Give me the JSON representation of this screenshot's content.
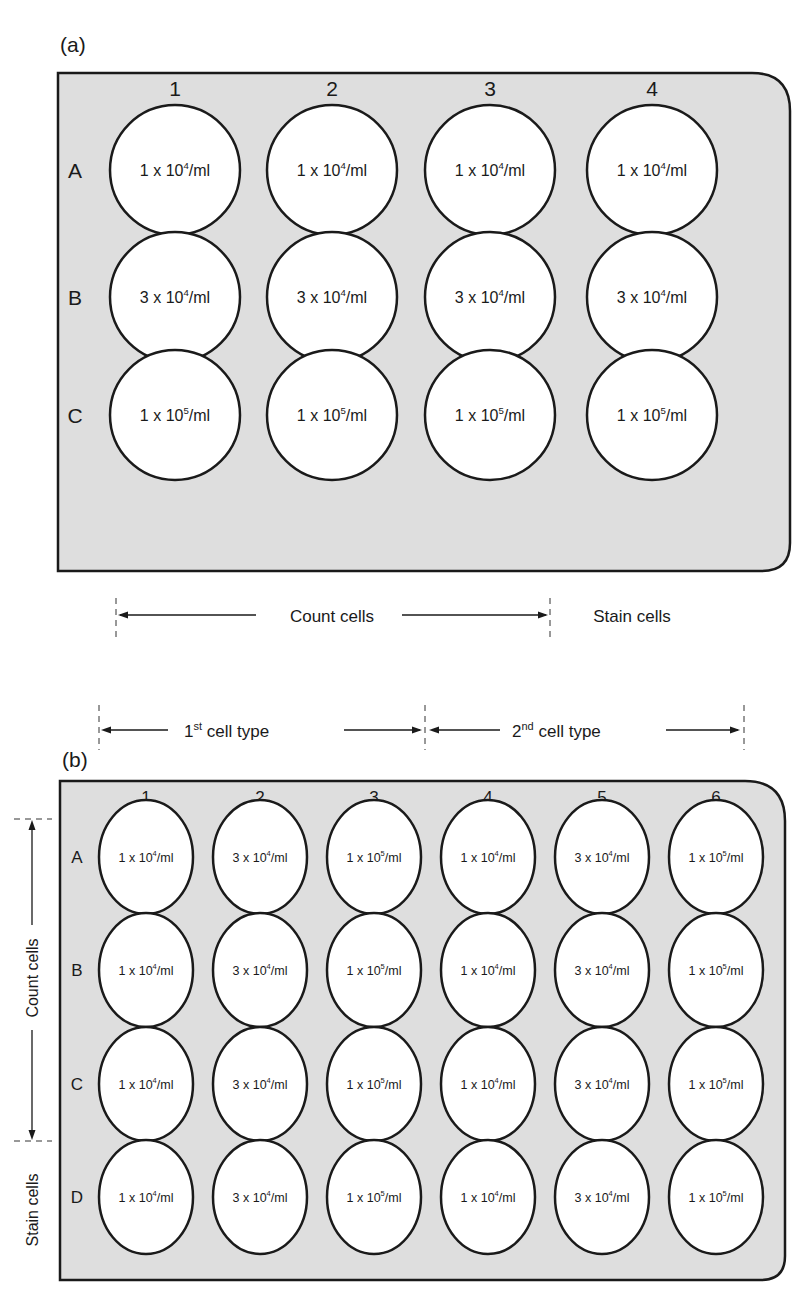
{
  "panel_a": {
    "label": "(a)",
    "columns": [
      "1",
      "2",
      "3",
      "4"
    ],
    "rows": [
      {
        "label": "A",
        "wells": [
          "1 x 10|4|/ml",
          "1 x 10|4|/ml",
          "1 x 10|4|/ml",
          "1 x 10|4|/ml"
        ]
      },
      {
        "label": "B",
        "wells": [
          "3 x 10|4|/ml",
          "3 x 10|4|/ml",
          "3 x 10|4|/ml",
          "3 x 10|4|/ml"
        ]
      },
      {
        "label": "C",
        "wells": [
          "1 x 10|5|/ml",
          "1 x 10|5|/ml",
          "1 x 10|5|/ml",
          "1 x 10|5|/ml"
        ]
      }
    ],
    "annotations": {
      "count_cells": "Count cells",
      "stain_cells": "Stain cells"
    }
  },
  "panel_b": {
    "label": "(b)",
    "columns": [
      "1",
      "2",
      "3",
      "4",
      "5",
      "6"
    ],
    "rows": [
      {
        "label": "A",
        "wells": [
          "1 x 10|4|/ml",
          "3 x 10|4|/ml",
          "1 x 10|5|/ml",
          "1 x 10|4|/ml",
          "3 x 10|4|/ml",
          "1 x 10|5|/ml"
        ]
      },
      {
        "label": "B",
        "wells": [
          "1 x 10|4|/ml",
          "3 x 10|4|/ml",
          "1 x 10|5|/ml",
          "1 x 10|4|/ml",
          "3 x 10|4|/ml",
          "1 x 10|5|/ml"
        ]
      },
      {
        "label": "C",
        "wells": [
          "1 x 10|4|/ml",
          "3 x 10|4|/ml",
          "1 x 10|5|/ml",
          "1 x 10|4|/ml",
          "3 x 10|4|/ml",
          "1 x 10|5|/ml"
        ]
      },
      {
        "label": "D",
        "wells": [
          "1 x 10|4|/ml",
          "3 x 10|4|/ml",
          "1 x 10|5|/ml",
          "1 x 10|4|/ml",
          "3 x 10|4|/ml",
          "1 x 10|5|/ml"
        ]
      }
    ],
    "annotations": {
      "first_cell_type": {
        "num": "1",
        "sup": "st",
        "text": " cell type"
      },
      "second_cell_type": {
        "num": "2",
        "sup": "nd",
        "text": " cell type"
      },
      "count_cells": "Count cells",
      "stain_cells": "Stain cells"
    }
  }
}
